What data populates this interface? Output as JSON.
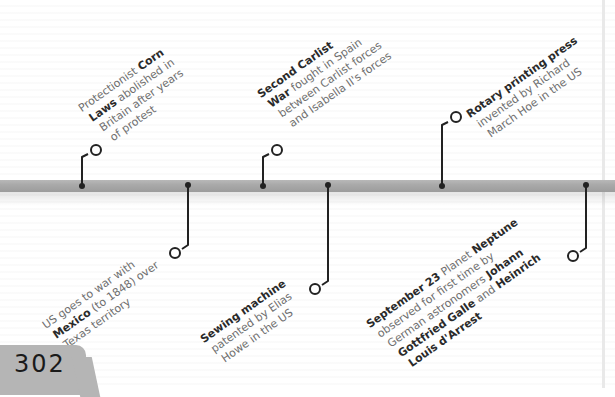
{
  "page": {
    "number": "302"
  },
  "colors": {
    "bar": "#a9a9a9",
    "stem": "#222222",
    "text": "#6e6e6e",
    "bold": "#2a2a2a",
    "tab": "#b5b5b5"
  },
  "events": [
    {
      "id": "corn-laws",
      "position": "above",
      "x": 82,
      "lines": [
        [
          {
            "t": "Protectionist ",
            "b": false
          },
          {
            "t": "Corn",
            "b": true
          }
        ],
        [
          {
            "t": "Laws",
            "b": true
          },
          {
            "t": " abolished in",
            "b": false
          }
        ],
        [
          {
            "t": "Britain after years",
            "b": false
          }
        ],
        [
          {
            "t": "of protest",
            "b": false
          }
        ]
      ]
    },
    {
      "id": "mexico-war",
      "position": "below",
      "x": 188,
      "lines": [
        [
          {
            "t": "US goes to war with",
            "b": false
          }
        ],
        [
          {
            "t": "Mexico",
            "b": true
          },
          {
            "t": " (to 1848) over",
            "b": false
          }
        ],
        [
          {
            "t": "Texas territory",
            "b": false
          }
        ]
      ]
    },
    {
      "id": "carlist-war",
      "position": "above",
      "x": 263,
      "lines": [
        [
          {
            "t": "Second Carlist",
            "b": true
          }
        ],
        [
          {
            "t": "War",
            "b": true
          },
          {
            "t": " fought in Spain",
            "b": false
          }
        ],
        [
          {
            "t": "between Carlist forces",
            "b": false
          }
        ],
        [
          {
            "t": "and Isabella II's forces",
            "b": false
          }
        ]
      ]
    },
    {
      "id": "sewing-machine",
      "position": "below",
      "x": 328,
      "lines": [
        [
          {
            "t": "Sewing machine",
            "b": true
          }
        ],
        [
          {
            "t": "patented by Elias",
            "b": false
          }
        ],
        [
          {
            "t": "Howe in the US",
            "b": false
          }
        ]
      ]
    },
    {
      "id": "rotary-press",
      "position": "above",
      "x": 442,
      "lines": [
        [
          {
            "t": "Rotary printing press",
            "b": true
          }
        ],
        [
          {
            "t": "invented by Richard",
            "b": false
          }
        ],
        [
          {
            "t": "March Hoe in the US",
            "b": false
          }
        ]
      ]
    },
    {
      "id": "neptune",
      "position": "below",
      "x": 586,
      "lines": [
        [
          {
            "t": "September 23",
            "b": true
          },
          {
            "t": " Planet ",
            "b": false
          },
          {
            "t": "Neptune",
            "b": true
          }
        ],
        [
          {
            "t": "observed for first time by",
            "b": false
          }
        ],
        [
          {
            "t": "German astronomers ",
            "b": false
          },
          {
            "t": "Johann",
            "b": true
          }
        ],
        [
          {
            "t": "Gottfried Galle",
            "b": true
          },
          {
            "t": " and ",
            "b": false
          },
          {
            "t": "Heinrich",
            "b": true
          }
        ],
        [
          {
            "t": "Louis d'Arrest",
            "b": true
          }
        ]
      ]
    }
  ]
}
